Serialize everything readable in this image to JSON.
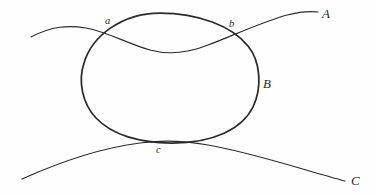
{
  "figure": {
    "type": "line-diagram",
    "background_color": "#fefefe",
    "stroke_color": "#2b2b2b",
    "width": 377,
    "height": 195,
    "labels": {
      "curve_a_upper": "A",
      "curve_b_closed": "B",
      "curve_c_lower": "C",
      "point_a": "a",
      "point_b": "b",
      "point_c": "c"
    },
    "curves": [
      {
        "id": "A",
        "name": "upper-open-curve",
        "label": "A",
        "kind": "open",
        "stroke_width": 1.15,
        "path": "M 31 37 C 52 26 68 25 86 28 C 108 32 128 44 150 50 C 168 55 188 53 208 45 C 232 36 262 22 287 15 C 299 12 310 11 318 12"
      },
      {
        "id": "B",
        "name": "closed-oval-curve",
        "label": "B",
        "kind": "closed",
        "stroke_width": 1.75,
        "path": "M 160 13 C 198 13 232 26 248 46 C 261 62 262 88 253 107 C 242 129 214 143 172 143 C 140 143 112 135 96 118 C 82 103 78 81 84 63 C 92 36 122 13 160 13 Z"
      },
      {
        "id": "C",
        "name": "lower-open-curve",
        "label": "C",
        "kind": "open",
        "stroke_width": 1.15,
        "path": "M 22 179 C 60 162 100 148 140 143 C 162 140 186 141 208 145 C 250 152 304 170 345 181"
      }
    ],
    "intersections": [
      {
        "label": "a",
        "x": 111,
        "y": 33,
        "between": [
          "A",
          "B"
        ]
      },
      {
        "label": "b",
        "x": 234,
        "y": 37,
        "between": [
          "A",
          "B"
        ]
      },
      {
        "label": "c",
        "x": 161,
        "y": 143,
        "between": [
          "B",
          "C"
        ],
        "relation": "tangent"
      }
    ],
    "label_positions": [
      {
        "key": "point_a",
        "text": "a",
        "x": 105,
        "y": 16,
        "size": "minor"
      },
      {
        "key": "point_b",
        "text": "b",
        "x": 229,
        "y": 19,
        "size": "minor"
      },
      {
        "key": "point_c",
        "text": "c",
        "x": 156,
        "y": 145,
        "size": "minor"
      },
      {
        "key": "curve_a_upper",
        "text": "A",
        "x": 322,
        "y": 7,
        "size": "major"
      },
      {
        "key": "curve_b_closed",
        "text": "B",
        "x": 263,
        "y": 77,
        "size": "major"
      },
      {
        "key": "curve_c_lower",
        "text": "C",
        "x": 351,
        "y": 174,
        "size": "major"
      }
    ]
  }
}
